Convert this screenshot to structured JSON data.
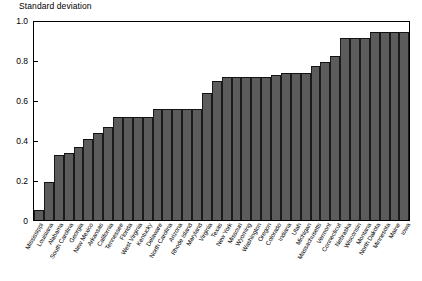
{
  "chart_data": {
    "type": "bar",
    "title": "Standard deviation",
    "xlabel": "",
    "ylabel": "Standard deviation",
    "ylim": [
      0,
      1.0
    ],
    "ytick_labels": [
      "0",
      "0.2",
      "0.4",
      "0.6",
      "0.8",
      "1.0"
    ],
    "ytick_values": [
      0,
      0.2,
      0.4,
      0.6,
      0.8,
      1.0
    ],
    "grid": false,
    "legend": "none",
    "bar_color": "#5c5c5c",
    "categories": [
      "Mississippi",
      "Louisiana",
      "Alabama",
      "South Carolina",
      "Georgia",
      "New Mexico",
      "Arkansas",
      "California",
      "Tennessee",
      "Florida",
      "West Virginia",
      "Kentucky",
      "Delaware",
      "North Carolina",
      "Arizona",
      "Rhode Island",
      "Maryland",
      "Virginia",
      "Texas",
      "New York",
      "Missouri",
      "Wyoming",
      "Washington",
      "Oregon",
      "Colorado",
      "Indiana",
      "Utah",
      "Michigan",
      "Massachusetts",
      "Vermont",
      "Connecticut",
      "Nebraska",
      "Wisconsin",
      "Montana",
      "North Dakota",
      "Minnesota",
      "Maine",
      "Iowa"
    ],
    "values": [
      0.05,
      0.19,
      0.33,
      0.34,
      0.37,
      0.41,
      0.44,
      0.47,
      0.52,
      0.52,
      0.52,
      0.52,
      0.56,
      0.56,
      0.56,
      0.56,
      0.56,
      0.64,
      0.7,
      0.72,
      0.72,
      0.72,
      0.72,
      0.72,
      0.73,
      0.74,
      0.74,
      0.74,
      0.78,
      0.8,
      0.83,
      0.92,
      0.92,
      0.92,
      0.95,
      0.95,
      0.95,
      0.95
    ]
  }
}
